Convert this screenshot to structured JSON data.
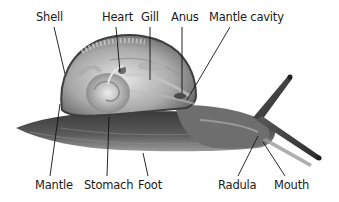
{
  "diagram": {
    "labels": {
      "shell": "Shell",
      "heart": "Heart",
      "gill": "Gill",
      "anus": "Anus",
      "mantle_cavity": "Mantle cavity",
      "mantle": "Mantle",
      "stomach": "Stomach",
      "foot": "Foot",
      "radula": "Radula",
      "mouth": "Mouth"
    },
    "colors": {
      "background": "#ffffff",
      "label_text": "#1a1a1a",
      "leader_line": "#111111",
      "body_dark": "#2e2e2e",
      "body_mid": "#777777",
      "shell_light": "#cfcfcf"
    }
  }
}
